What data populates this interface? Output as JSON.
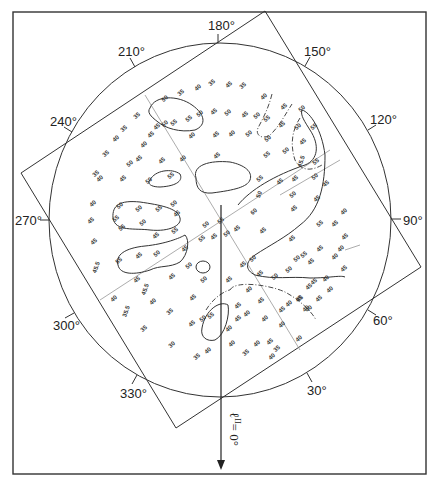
{
  "figure": {
    "axis_label": "ℓ",
    "axis_superscript": "II",
    "axis_value": "= 0°",
    "angle_labels": [
      {
        "text": "180°",
        "angle": 180
      },
      {
        "text": "210°",
        "angle": 210
      },
      {
        "text": "150°",
        "angle": 150
      },
      {
        "text": "240°",
        "angle": 240
      },
      {
        "text": "120°",
        "angle": 120
      },
      {
        "text": "270°",
        "angle": 270
      },
      {
        "text": "90°",
        "angle": 90
      },
      {
        "text": "300°",
        "angle": 300
      },
      {
        "text": "60°",
        "angle": 60
      },
      {
        "text": "330°",
        "angle": 330
      },
      {
        "text": "30°",
        "angle": 30
      }
    ],
    "data_labels": [
      {
        "x": 182,
        "y": 94,
        "t": "35",
        "r": -40
      },
      {
        "x": 199,
        "y": 89,
        "t": "40",
        "r": -40
      },
      {
        "x": 213,
        "y": 84,
        "t": "35",
        "r": -40
      },
      {
        "x": 230,
        "y": 86,
        "t": "45",
        "r": -40
      },
      {
        "x": 244,
        "y": 87,
        "t": "35",
        "r": -40
      },
      {
        "x": 166,
        "y": 100,
        "t": "50",
        "r": -40
      },
      {
        "x": 190,
        "y": 120,
        "t": "55",
        "r": -40
      },
      {
        "x": 201,
        "y": 115,
        "t": "50",
        "r": -40
      },
      {
        "x": 215,
        "y": 113,
        "t": "45",
        "r": -40
      },
      {
        "x": 229,
        "y": 114,
        "t": "50",
        "r": -40
      },
      {
        "x": 246,
        "y": 116,
        "t": "45",
        "r": -40
      },
      {
        "x": 258,
        "y": 117,
        "t": "50",
        "r": -40
      },
      {
        "x": 268,
        "y": 120,
        "t": "55",
        "r": -40
      },
      {
        "x": 138,
        "y": 117,
        "t": "35",
        "r": -40
      },
      {
        "x": 158,
        "y": 128,
        "t": "45",
        "r": -40
      },
      {
        "x": 166,
        "y": 125,
        "t": "50",
        "r": -40
      },
      {
        "x": 175,
        "y": 124,
        "t": "55",
        "r": -40
      },
      {
        "x": 193,
        "y": 137,
        "t": "40",
        "r": -40
      },
      {
        "x": 217,
        "y": 136,
        "t": "45",
        "r": -40
      },
      {
        "x": 233,
        "y": 135,
        "t": "40",
        "r": -40
      },
      {
        "x": 250,
        "y": 135,
        "t": "50",
        "r": -40
      },
      {
        "x": 125,
        "y": 130,
        "t": "35",
        "r": -40
      },
      {
        "x": 117,
        "y": 140,
        "t": "40",
        "r": -40
      },
      {
        "x": 152,
        "y": 136,
        "t": "45",
        "r": -40
      },
      {
        "x": 145,
        "y": 146,
        "t": "40",
        "r": -40
      },
      {
        "x": 140,
        "y": 160,
        "t": "45",
        "r": -40
      },
      {
        "x": 131,
        "y": 165,
        "t": "50",
        "r": -40
      },
      {
        "x": 163,
        "y": 162,
        "t": "45",
        "r": -40
      },
      {
        "x": 184,
        "y": 160,
        "t": "40",
        "r": -40
      },
      {
        "x": 218,
        "y": 157,
        "t": "45",
        "r": -40
      },
      {
        "x": 107,
        "y": 155,
        "t": "35",
        "r": -40
      },
      {
        "x": 97,
        "y": 175,
        "t": "35",
        "r": -40
      },
      {
        "x": 101,
        "y": 180,
        "t": "40",
        "r": -40
      },
      {
        "x": 124,
        "y": 180,
        "t": "45",
        "r": -40
      },
      {
        "x": 150,
        "y": 182,
        "t": "50",
        "r": -40
      },
      {
        "x": 172,
        "y": 177,
        "t": "55",
        "r": -40
      },
      {
        "x": 94,
        "y": 205,
        "t": "40",
        "r": -40
      },
      {
        "x": 92,
        "y": 222,
        "t": "45",
        "r": -40
      },
      {
        "x": 121,
        "y": 207,
        "t": "50",
        "r": -40
      },
      {
        "x": 117,
        "y": 220,
        "t": "55",
        "r": -40
      },
      {
        "x": 140,
        "y": 210,
        "t": "50",
        "r": -40
      },
      {
        "x": 160,
        "y": 210,
        "t": "55",
        "r": -40
      },
      {
        "x": 175,
        "y": 205,
        "t": "50",
        "r": -40
      },
      {
        "x": 178,
        "y": 215,
        "t": "45",
        "r": -40
      },
      {
        "x": 95,
        "y": 243,
        "t": "45",
        "r": -40
      },
      {
        "x": 98,
        "y": 268,
        "t": "45.5",
        "r": -70
      },
      {
        "x": 123,
        "y": 229,
        "t": "55",
        "r": -40
      },
      {
        "x": 144,
        "y": 224,
        "t": "50",
        "r": -40
      },
      {
        "x": 157,
        "y": 237,
        "t": "45",
        "r": -40
      },
      {
        "x": 176,
        "y": 232,
        "t": "55",
        "r": -40
      },
      {
        "x": 120,
        "y": 262,
        "t": "55",
        "r": -40
      },
      {
        "x": 140,
        "y": 257,
        "t": "45",
        "r": -40
      },
      {
        "x": 158,
        "y": 255,
        "t": "50",
        "r": -40
      },
      {
        "x": 186,
        "y": 250,
        "t": "45",
        "r": -40
      },
      {
        "x": 115,
        "y": 300,
        "t": "40",
        "r": -40
      },
      {
        "x": 138,
        "y": 281,
        "t": "45",
        "r": -40
      },
      {
        "x": 147,
        "y": 290,
        "t": "45.5",
        "r": -70
      },
      {
        "x": 154,
        "y": 303,
        "t": "40",
        "r": -40
      },
      {
        "x": 171,
        "y": 313,
        "t": "35",
        "r": -40
      },
      {
        "x": 173,
        "y": 278,
        "t": "45",
        "r": -40
      },
      {
        "x": 190,
        "y": 267,
        "t": "50",
        "r": -40
      },
      {
        "x": 128,
        "y": 312,
        "t": "35.5",
        "r": -70
      },
      {
        "x": 145,
        "y": 330,
        "t": "35",
        "r": -40
      },
      {
        "x": 173,
        "y": 346,
        "t": "30",
        "r": -40
      },
      {
        "x": 198,
        "y": 358,
        "t": "35",
        "r": -40
      },
      {
        "x": 209,
        "y": 352,
        "t": "40",
        "r": -40
      },
      {
        "x": 193,
        "y": 325,
        "t": "45",
        "r": -40
      },
      {
        "x": 204,
        "y": 320,
        "t": "50",
        "r": -40
      },
      {
        "x": 212,
        "y": 317,
        "t": "55",
        "r": -40
      },
      {
        "x": 194,
        "y": 299,
        "t": "45",
        "r": -40
      },
      {
        "x": 205,
        "y": 281,
        "t": "50",
        "r": -40
      },
      {
        "x": 203,
        "y": 240,
        "t": "55",
        "r": -40
      },
      {
        "x": 215,
        "y": 238,
        "t": "45",
        "r": -40
      },
      {
        "x": 228,
        "y": 235,
        "t": "50",
        "r": -40
      },
      {
        "x": 238,
        "y": 230,
        "t": "45",
        "r": -40
      },
      {
        "x": 207,
        "y": 226,
        "t": "50",
        "r": -40
      },
      {
        "x": 222,
        "y": 222,
        "t": "55",
        "r": -40
      },
      {
        "x": 255,
        "y": 213,
        "t": "60",
        "r": -40
      },
      {
        "x": 261,
        "y": 195,
        "t": "50",
        "r": -70
      },
      {
        "x": 261,
        "y": 180,
        "t": "55",
        "r": -40
      },
      {
        "x": 281,
        "y": 183,
        "t": "45",
        "r": -40
      },
      {
        "x": 268,
        "y": 156,
        "t": "55",
        "r": -40
      },
      {
        "x": 287,
        "y": 152,
        "t": "50",
        "r": -40
      },
      {
        "x": 304,
        "y": 143,
        "t": "45",
        "r": -40
      },
      {
        "x": 269,
        "y": 140,
        "t": "50",
        "r": -40
      },
      {
        "x": 283,
        "y": 126,
        "t": "45",
        "r": -40
      },
      {
        "x": 303,
        "y": 110,
        "t": "50",
        "r": -40
      },
      {
        "x": 265,
        "y": 98,
        "t": "40",
        "r": -40
      },
      {
        "x": 285,
        "y": 108,
        "t": "45",
        "r": -40
      },
      {
        "x": 299,
        "y": 128,
        "t": "50",
        "r": -40
      },
      {
        "x": 315,
        "y": 128,
        "t": "55",
        "r": -40
      },
      {
        "x": 296,
        "y": 180,
        "t": "45",
        "r": -40
      },
      {
        "x": 294,
        "y": 196,
        "t": "50",
        "r": -40
      },
      {
        "x": 295,
        "y": 210,
        "t": "45",
        "r": -40
      },
      {
        "x": 317,
        "y": 163,
        "t": "55",
        "r": -40
      },
      {
        "x": 316,
        "y": 178,
        "t": "50",
        "r": -40
      },
      {
        "x": 327,
        "y": 185,
        "t": "45",
        "r": -40
      },
      {
        "x": 318,
        "y": 200,
        "t": "45",
        "r": -40
      },
      {
        "x": 321,
        "y": 225,
        "t": "55",
        "r": -40
      },
      {
        "x": 321,
        "y": 250,
        "t": "45",
        "r": -40
      },
      {
        "x": 336,
        "y": 225,
        "t": "45",
        "r": -40
      },
      {
        "x": 342,
        "y": 250,
        "t": "40",
        "r": -40
      },
      {
        "x": 345,
        "y": 270,
        "t": "45",
        "r": -40
      },
      {
        "x": 303,
        "y": 162,
        "t": "45.5",
        "r": -70
      },
      {
        "x": 345,
        "y": 213,
        "t": "40",
        "r": -40
      },
      {
        "x": 346,
        "y": 238,
        "t": "45",
        "r": -40
      },
      {
        "x": 336,
        "y": 258,
        "t": "40",
        "r": -40
      },
      {
        "x": 264,
        "y": 232,
        "t": "45",
        "r": -40
      },
      {
        "x": 293,
        "y": 240,
        "t": "45",
        "r": -40
      },
      {
        "x": 298,
        "y": 260,
        "t": "50",
        "r": -40
      },
      {
        "x": 305,
        "y": 256,
        "t": "55",
        "r": -40
      },
      {
        "x": 312,
        "y": 263,
        "t": "45",
        "r": -40
      },
      {
        "x": 290,
        "y": 271,
        "t": "50",
        "r": -40
      },
      {
        "x": 310,
        "y": 288,
        "t": "45",
        "r": -40
      },
      {
        "x": 315,
        "y": 283,
        "t": "45",
        "r": -40
      },
      {
        "x": 331,
        "y": 291,
        "t": "40",
        "r": -40
      },
      {
        "x": 244,
        "y": 266,
        "t": "45",
        "r": -40
      },
      {
        "x": 254,
        "y": 260,
        "t": "50",
        "r": -40
      },
      {
        "x": 261,
        "y": 275,
        "t": "45",
        "r": -40
      },
      {
        "x": 276,
        "y": 278,
        "t": "50",
        "r": -40
      },
      {
        "x": 230,
        "y": 281,
        "t": "45",
        "r": -40
      },
      {
        "x": 250,
        "y": 291,
        "t": "40",
        "r": -40
      },
      {
        "x": 239,
        "y": 307,
        "t": "45",
        "r": -40
      },
      {
        "x": 248,
        "y": 315,
        "t": "40",
        "r": -40
      },
      {
        "x": 262,
        "y": 302,
        "t": "45",
        "r": -40
      },
      {
        "x": 266,
        "y": 320,
        "t": "40",
        "r": -40
      },
      {
        "x": 283,
        "y": 311,
        "t": "45",
        "r": -40
      },
      {
        "x": 290,
        "y": 305,
        "t": "40",
        "r": -40
      },
      {
        "x": 300,
        "y": 300,
        "t": "45",
        "r": -40
      },
      {
        "x": 307,
        "y": 310,
        "t": "40",
        "r": -40
      },
      {
        "x": 230,
        "y": 330,
        "t": "40",
        "r": -40
      },
      {
        "x": 239,
        "y": 320,
        "t": "45",
        "r": -40
      },
      {
        "x": 258,
        "y": 345,
        "t": "40",
        "r": -40
      },
      {
        "x": 271,
        "y": 343,
        "t": "45",
        "r": -40
      },
      {
        "x": 283,
        "y": 326,
        "t": "40",
        "r": -40
      },
      {
        "x": 301,
        "y": 300,
        "t": "45",
        "r": -40
      },
      {
        "x": 233,
        "y": 345,
        "t": "40",
        "r": -40
      },
      {
        "x": 247,
        "y": 354,
        "t": "35",
        "r": -40
      },
      {
        "x": 273,
        "y": 358,
        "t": "40",
        "r": -40
      },
      {
        "x": 278,
        "y": 350,
        "t": "35",
        "r": -40
      },
      {
        "x": 300,
        "y": 340,
        "t": "40",
        "r": -40
      },
      {
        "x": 310,
        "y": 310,
        "t": "40",
        "r": -40
      },
      {
        "x": 320,
        "y": 300,
        "t": "45",
        "r": -40
      },
      {
        "x": 327,
        "y": 280,
        "t": "40",
        "r": -40
      }
    ]
  }
}
